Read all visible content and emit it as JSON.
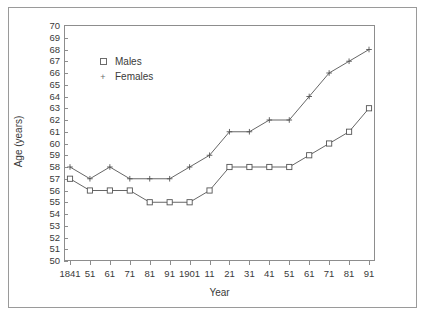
{
  "chart_data": {
    "type": "line",
    "title": "",
    "xlabel": "Year",
    "ylabel": "Age (years)",
    "ylim": [
      50,
      70
    ],
    "ytick_step": 1,
    "yticks": [
      70,
      69,
      68,
      67,
      66,
      65,
      64,
      63,
      62,
      61,
      60,
      59,
      58,
      57,
      56,
      55,
      54,
      53,
      52,
      51,
      50
    ],
    "categories": [
      "1841",
      "51",
      "61",
      "71",
      "81",
      "91",
      "1901",
      "11",
      "21",
      "31",
      "41",
      "51",
      "61",
      "71",
      "81",
      "91"
    ],
    "grid": false,
    "legend_position": "upper-left-inside",
    "series": [
      {
        "name": "Males",
        "marker": "square",
        "color": "#555555",
        "values": [
          57,
          56,
          56,
          56,
          55,
          55,
          55,
          56,
          58,
          58,
          58,
          58,
          59,
          60,
          61,
          63
        ]
      },
      {
        "name": "Females",
        "marker": "plus",
        "color": "#555555",
        "values": [
          58,
          57,
          58,
          57,
          57,
          57,
          58,
          59,
          61,
          61,
          62,
          62,
          64,
          66,
          67,
          68
        ]
      }
    ]
  },
  "legend": {
    "items": [
      {
        "label": "Males",
        "marker": "square"
      },
      {
        "label": "Females",
        "marker": "plus"
      }
    ]
  },
  "axes": {
    "y_title": "Age (years)",
    "x_title": "Year"
  }
}
